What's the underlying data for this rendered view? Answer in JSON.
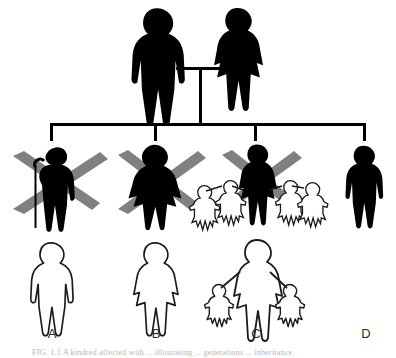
{
  "figure": {
    "type": "pedigree-chart",
    "background_color": "#ffffff",
    "affected_color": "#000000",
    "unaffected_color": "#ffffff",
    "outline_color": "#1a1a1a",
    "deceased_mark_color": "#808080",
    "connector_color": "#000000",
    "caption": "FIG. 1.1  A kindred affected with ... illustrating ... generations ... inheritance"
  },
  "generations": {
    "parents": [
      {
        "id": "father",
        "sex": "male",
        "status": "affected",
        "fill": "#000000"
      },
      {
        "id": "mother",
        "sex": "female",
        "status": "affected",
        "fill": "#000000"
      }
    ],
    "children": [
      {
        "id": "A",
        "label": "A",
        "sex": "male",
        "status": "affected",
        "deceased": true,
        "has_cane": true,
        "offspring_count": 0,
        "x": 52
      },
      {
        "id": "B",
        "label": "B",
        "sex": "female",
        "status": "affected",
        "deceased": true,
        "has_cane": false,
        "offspring_count": 0,
        "x": 155
      },
      {
        "id": "C",
        "label": "C",
        "sex": "female",
        "status": "affected",
        "deceased": true,
        "has_cane": false,
        "offspring_count": 4,
        "x": 255
      },
      {
        "id": "D",
        "label": "D",
        "sex": "male",
        "status": "affected",
        "deceased": false,
        "has_cane": false,
        "offspring_count": 0,
        "x": 365
      }
    ],
    "outline_row": [
      {
        "id": "A-outline",
        "label": "A",
        "sex": "male",
        "status": "unaffected",
        "children": 0,
        "x": 52
      },
      {
        "id": "B-outline",
        "label": "B",
        "sex": "female",
        "status": "unaffected",
        "children": 0,
        "x": 155
      },
      {
        "id": "C-outline",
        "label": "C",
        "sex": "female",
        "status": "unaffected",
        "children": 2,
        "x": 258
      },
      {
        "id": "D-outline",
        "label": "D",
        "sex": "none",
        "status": "absent",
        "children": 0,
        "x": 365
      }
    ]
  },
  "labels": {
    "a": "A",
    "b": "B",
    "c": "C",
    "d": "D"
  }
}
